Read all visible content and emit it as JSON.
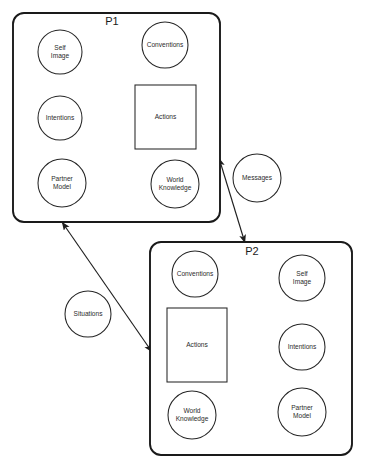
{
  "diagram": {
    "agents": [
      {
        "id": "P1",
        "label": "P1",
        "box": {
          "x": 13,
          "y": 13,
          "width": 207,
          "height": 209,
          "radius": 11
        },
        "title_pos": {
          "x": 112,
          "y": 22
        },
        "modules": [
          {
            "name": "self-image",
            "label_lines": [
              "Self",
              "Image"
            ],
            "shape": "circle",
            "cx": 60,
            "cy": 52,
            "r": 22
          },
          {
            "name": "conventions",
            "label_lines": [
              "Conventions"
            ],
            "shape": "circle",
            "cx": 165,
            "cy": 45,
            "r": 23
          },
          {
            "name": "intentions",
            "label_lines": [
              "Intentions"
            ],
            "shape": "circle",
            "cx": 60,
            "cy": 118,
            "r": 22
          },
          {
            "name": "actions",
            "label_lines": [
              "Actions"
            ],
            "shape": "rect",
            "x": 135,
            "y": 85,
            "width": 61,
            "height": 64
          },
          {
            "name": "partner-model",
            "label_lines": [
              "Partner",
              "Model"
            ],
            "shape": "circle",
            "cx": 62,
            "cy": 183,
            "r": 24
          },
          {
            "name": "world-knowledge",
            "label_lines": [
              "World",
              "Knowledge"
            ],
            "shape": "circle",
            "cx": 175,
            "cy": 184,
            "r": 24
          }
        ]
      },
      {
        "id": "P2",
        "label": "P2",
        "box": {
          "x": 150,
          "y": 242,
          "width": 202,
          "height": 213,
          "radius": 11
        },
        "title_pos": {
          "x": 252,
          "y": 252
        },
        "modules": [
          {
            "name": "conventions",
            "label_lines": [
              "Conventions"
            ],
            "shape": "circle",
            "cx": 195,
            "cy": 274,
            "r": 23
          },
          {
            "name": "self-image",
            "label_lines": [
              "Self",
              "Image"
            ],
            "shape": "circle",
            "cx": 302,
            "cy": 278,
            "r": 23
          },
          {
            "name": "actions",
            "label_lines": [
              "Actions"
            ],
            "shape": "rect",
            "x": 167,
            "y": 308,
            "width": 60,
            "height": 74
          },
          {
            "name": "intentions",
            "label_lines": [
              "Intentions"
            ],
            "shape": "circle",
            "cx": 302,
            "cy": 347,
            "r": 23
          },
          {
            "name": "world-knowledge",
            "label_lines": [
              "World",
              "Knowledge"
            ],
            "shape": "circle",
            "cx": 192,
            "cy": 415,
            "r": 24
          },
          {
            "name": "partner-model",
            "label_lines": [
              "Partner",
              "Model"
            ],
            "shape": "circle",
            "cx": 302,
            "cy": 412,
            "r": 24
          }
        ]
      }
    ],
    "channels": [
      {
        "name": "messages",
        "label_lines": [
          "Messages"
        ],
        "shape": "circle",
        "cx": 257,
        "cy": 178,
        "r": 24
      },
      {
        "name": "situations",
        "label_lines": [
          "Situations"
        ],
        "shape": "circle",
        "cx": 88,
        "cy": 314,
        "r": 23
      }
    ],
    "links": [
      {
        "name": "messages-link",
        "from": "P1",
        "to": "P2",
        "x1": 219,
        "y1": 158,
        "x2": 245,
        "y2": 243,
        "double_headed": true
      },
      {
        "name": "situations-link",
        "from": "P1",
        "to": "P2",
        "x1": 62,
        "y1": 222,
        "x2": 152,
        "y2": 352,
        "double_headed": true
      }
    ],
    "colors": {
      "background": "#ffffff",
      "agent_box_stroke": "#1a1a1a",
      "module_stroke": "#262626",
      "arrow_stroke": "#1f1f1f",
      "label_text": "#2b2b2b",
      "title_text": "#1a1a1a"
    }
  }
}
